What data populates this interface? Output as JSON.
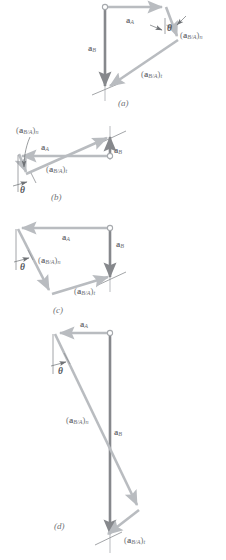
{
  "figure": {
    "colors": {
      "vector_light": "#b9bcc0",
      "vector_dark": "#8e9398",
      "ab_arrow": "#86888c",
      "reference_line": "#9a9da1",
      "leader_line": "#7d8084",
      "text": "#6f7276",
      "background": "#ffffff"
    },
    "label_text": {
      "a_A": "a",
      "a_A_sub": "A",
      "a_B": "a",
      "a_B_sub": "B",
      "a_rel_n": "a",
      "a_rel_n_sub": "B/A",
      "a_rel_n_suffix": "n",
      "a_rel_t": "a",
      "a_rel_t_sub": "B/A",
      "a_rel_t_suffix": "t",
      "theta": "θ",
      "paren_open": "(",
      "paren_close": ")"
    },
    "panels": [
      {
        "id": "a",
        "caption": "(a)",
        "caption_x": 118,
        "caption_y": 99,
        "labels": {
          "a_A": {
            "x": 126,
            "y": 16
          },
          "a_B": {
            "x": 88,
            "y": 48
          },
          "a_rel_n": {
            "x": 180,
            "y": 33
          },
          "a_rel_t": {
            "x": 144,
            "y": 72
          },
          "theta": {
            "x": 163,
            "y": 29
          }
        }
      },
      {
        "id": "b",
        "caption": "(b)",
        "caption_x": 51,
        "caption_y": 193,
        "labels": {
          "a_A": {
            "x": 39,
            "y": 145
          },
          "a_B": {
            "x": 113,
            "y": 148
          },
          "a_rel_n": {
            "x": 20,
            "y": 127
          },
          "a_rel_t": {
            "x": 46,
            "y": 167
          },
          "theta": {
            "x": 20,
            "y": 184
          }
        }
      },
      {
        "id": "c",
        "caption": "(c)",
        "caption_x": 53,
        "caption_y": 306,
        "labels": {
          "a_A": {
            "x": 63,
            "y": 234
          },
          "a_B": {
            "x": 117,
            "y": 241
          },
          "a_rel_n": {
            "x": 38,
            "y": 258
          },
          "a_rel_t": {
            "x": 75,
            "y": 285
          },
          "theta": {
            "x": 20,
            "y": 260
          }
        }
      },
      {
        "id": "d",
        "caption": "(d)",
        "caption_x": 54,
        "caption_y": 522,
        "labels": {
          "a_A": {
            "x": 80,
            "y": 320
          },
          "a_B": {
            "x": 115,
            "y": 430
          },
          "a_rel_n": {
            "x": 68,
            "y": 417
          },
          "a_rel_t": {
            "x": 125,
            "y": 536
          },
          "theta": {
            "x": 60,
            "y": 364
          }
        }
      }
    ]
  }
}
